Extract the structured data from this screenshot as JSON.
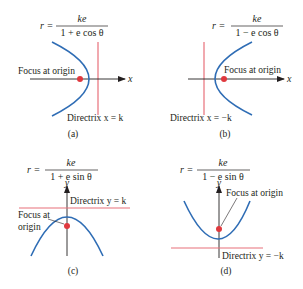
{
  "colors": {
    "curve": "#2f6db5",
    "directrix": "#e8707a",
    "focus": "#e0393e",
    "axis": "#231f20",
    "text": "#231f20"
  },
  "panels": [
    {
      "id": "a",
      "caption": "(a)",
      "equation": {
        "lhs": "r =",
        "numerator": "ke",
        "denominator": "1 + e cos θ"
      },
      "focus_label": "Focus at origin",
      "directrix_label": "Directrix x = k",
      "axis_label": "x",
      "orientation": "opens-left"
    },
    {
      "id": "b",
      "caption": "(b)",
      "equation": {
        "lhs": "r =",
        "numerator": "ke",
        "denominator": "1 − e cos θ"
      },
      "focus_label": "Focus at origin",
      "directrix_label": "Directrix x = −k",
      "axis_label": "x",
      "orientation": "opens-right"
    },
    {
      "id": "c",
      "caption": "(c)",
      "equation": {
        "lhs": "r =",
        "numerator": "ke",
        "denominator": "1 + e sin θ"
      },
      "focus_label_line1": "Focus at",
      "focus_label_line2": "origin",
      "directrix_label": "Directrix y = k",
      "axis_label": "y",
      "orientation": "opens-down"
    },
    {
      "id": "d",
      "caption": "(d)",
      "equation": {
        "lhs": "r =",
        "numerator": "ke",
        "denominator": "1 − e sin θ"
      },
      "focus_label": "Focus at origin",
      "directrix_label": "Directrix y = −k",
      "axis_label": "y",
      "orientation": "opens-up"
    }
  ]
}
